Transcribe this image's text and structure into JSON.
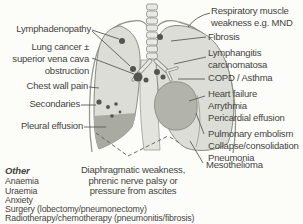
{
  "labels": {
    "left": [
      {
        "text": "Lymphadenopathy"
      },
      {
        "text": "Lung cancer ±\nsuperior vena cava\nobstruction"
      },
      {
        "text": "Chest wall pain"
      },
      {
        "text": "Secondaries"
      },
      {
        "text": "Pleural effusion"
      }
    ],
    "right": [
      {
        "text": "Respiratory muscle\nweakness e.g. MND"
      },
      {
        "text": "Fibrosis"
      },
      {
        "text": "Lymphangitis\ncarcinomatosa"
      },
      {
        "text": "COPD / Asthma"
      },
      {
        "text": "Heart failure\nArrythmia\nPericardial effusion"
      },
      {
        "text": "Pulmonary embolism\nCollapse/consolidation\nPneumonia"
      },
      {
        "text": "Mesothelioma"
      }
    ],
    "bottom_center": {
      "text": "Diaphragmatic weakness,\nphrenic nerve palsy or\npressure from ascites"
    }
  },
  "other": {
    "heading": "Other",
    "items": [
      {
        "text": "Anaemia"
      },
      {
        "text": "Uraemia"
      },
      {
        "text": "Anxiety"
      }
    ],
    "footnotes": [
      {
        "text": "Surgery (lobectomy/pneumonectomy)"
      },
      {
        "text": "Radiotherapy/chemotherapy (pneumonitis/fibrosis)"
      }
    ]
  },
  "colors": {
    "background": "#fcfcf9",
    "lung_fill": "#dbddd6",
    "lung_stroke": "#8b8d85",
    "mediastinum_fill": "#e3e4de",
    "trachea_fill": "#e8e9e4",
    "heart_fill": "#b2b4ac",
    "effusion_fill": "#a9aba2",
    "node_fill": "#54554e",
    "leader_line": "#5c5c56",
    "chest_wall_stroke": "#96988f",
    "text": "#45453f"
  }
}
